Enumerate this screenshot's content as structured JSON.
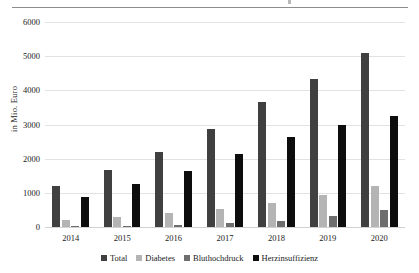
{
  "chart_data": {
    "type": "bar",
    "title": "",
    "xlabel": "",
    "ylabel": "in Mio. Euro",
    "categories": [
      "2014",
      "2015",
      "2016",
      "2017",
      "2018",
      "2019",
      "2020"
    ],
    "series": [
      {
        "name": "Total",
        "color": "#404040",
        "values": [
          1200,
          1670,
          2200,
          2880,
          3650,
          4340,
          5090
        ]
      },
      {
        "name": "Diabetes",
        "color": "#b4b4b4",
        "values": [
          200,
          290,
          420,
          540,
          700,
          930,
          1210
        ]
      },
      {
        "name": "Bluthochdruck",
        "color": "#6e6e6e",
        "values": [
          30,
          40,
          60,
          110,
          190,
          310,
          490
        ]
      },
      {
        "name": "Herzinsuffizienz",
        "color": "#0d0d0d",
        "values": [
          870,
          1250,
          1650,
          2130,
          2630,
          2980,
          3240
        ]
      }
    ],
    "ylim": [
      0,
      6000
    ],
    "yticks": [
      0,
      1000,
      2000,
      3000,
      4000,
      5000,
      6000
    ],
    "ytick_labels": [
      "0",
      "1000",
      "2000",
      "3000",
      "4000",
      "5000",
      "6000"
    ],
    "grid": true,
    "legend_position": "bottom"
  }
}
